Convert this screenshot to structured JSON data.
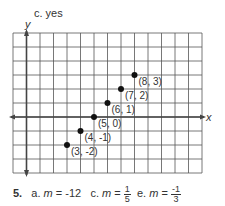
{
  "header": {
    "part_label": "c. yes",
    "y_axis_label": "y",
    "x_axis_label": "x"
  },
  "graph": {
    "grid": {
      "left": 13,
      "top": 33,
      "cols": 14,
      "rows": 10,
      "cell_w": 13.5,
      "cell_h": 14,
      "color": "#555555"
    },
    "origin_col": 1,
    "origin_row": 6
  },
  "chart_data": {
    "type": "scatter",
    "title": "c. yes",
    "xlabel": "x",
    "ylabel": "y",
    "grid": true,
    "x_range": [
      -1,
      13
    ],
    "y_range": [
      -4,
      6
    ],
    "points": [
      {
        "x": 3,
        "y": -2,
        "label": "(3, -2)"
      },
      {
        "x": 4,
        "y": -1,
        "label": "(4, -1)"
      },
      {
        "x": 5,
        "y": 0,
        "label": "(5, 0)"
      },
      {
        "x": 6,
        "y": 1,
        "label": "(6, 1)"
      },
      {
        "x": 7,
        "y": 2,
        "label": "(7, 2)"
      },
      {
        "x": 8,
        "y": 3,
        "label": "(8, 3)"
      }
    ]
  },
  "answer": {
    "number": "5.",
    "a_label": "a.",
    "a_var": "m",
    "a_eq": "=",
    "a_val": "-12",
    "c_label": "c.",
    "c_var": "m",
    "c_eq": "=",
    "c_num": "1",
    "c_den": "5",
    "e_label": "e.",
    "e_var": "m",
    "e_eq": "=",
    "e_num": "-1",
    "e_den": "3"
  }
}
